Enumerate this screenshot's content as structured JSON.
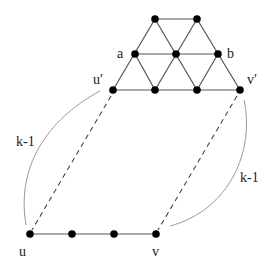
{
  "diagram": {
    "labels": {
      "a": "a",
      "b": "b",
      "u_prime": "u′",
      "v_prime": "v′",
      "u": "u",
      "v": "v",
      "left_arc": "k-1",
      "right_arc": "k-1"
    },
    "nodes": [
      {
        "id": "t1",
        "x": 155,
        "y": 19
      },
      {
        "id": "t2",
        "x": 197,
        "y": 19
      },
      {
        "id": "a",
        "x": 135,
        "y": 54
      },
      {
        "id": "m",
        "x": 176,
        "y": 54
      },
      {
        "id": "b",
        "x": 218,
        "y": 54
      },
      {
        "id": "u_prime",
        "x": 113,
        "y": 90
      },
      {
        "id": "r1",
        "x": 155,
        "y": 90
      },
      {
        "id": "r2",
        "x": 197,
        "y": 90
      },
      {
        "id": "v_prime",
        "x": 240,
        "y": 90
      },
      {
        "id": "u",
        "x": 30,
        "y": 234
      },
      {
        "id": "p1",
        "x": 72,
        "y": 234
      },
      {
        "id": "p2",
        "x": 114,
        "y": 234
      },
      {
        "id": "v",
        "x": 156,
        "y": 234
      }
    ],
    "colors": {
      "node": "#000000",
      "edge": "#555555",
      "arc": "#9a9a9a",
      "background": "#ffffff"
    }
  }
}
